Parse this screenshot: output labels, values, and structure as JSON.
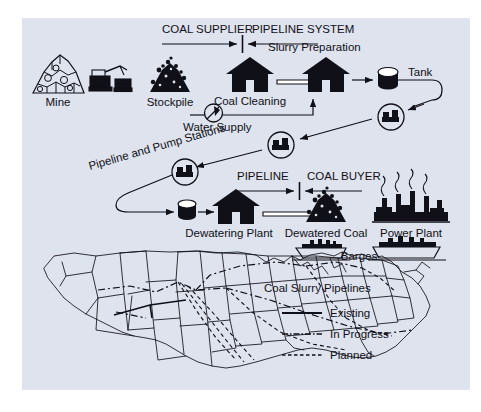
{
  "diagram": {
    "background_color": "#dfe3ed",
    "page_color": "#ffffff",
    "ink_color": "#101018"
  },
  "zones": [
    {
      "id": "coal-supplier",
      "label": "COAL SUPPLIER"
    },
    {
      "id": "pipeline-system",
      "label": "PIPELINE SYSTEM"
    },
    {
      "id": "pipeline",
      "label": "PIPELINE"
    },
    {
      "id": "coal-buyer",
      "label": "COAL BUYER"
    }
  ],
  "nodes": [
    {
      "id": "mine",
      "label": "Mine",
      "icon": "mine-icon"
    },
    {
      "id": "stockpile",
      "label": "Stockpile",
      "icon": "stockpile-icon"
    },
    {
      "id": "water-supply",
      "label": "Water Supply",
      "icon": "water-valve-icon"
    },
    {
      "id": "coal-cleaning",
      "label": "Coal Cleaning",
      "icon": "plant-building-icon"
    },
    {
      "id": "slurry-preparation",
      "label": "Slurry Preparation",
      "icon": "plant-building-icon"
    },
    {
      "id": "tank",
      "label": "Tank",
      "icon": "tank-icon"
    },
    {
      "id": "pump-stations",
      "label": "Pipeline and Pump Stations",
      "icon": "pump-station-icon"
    },
    {
      "id": "dewatering-plant",
      "label": "Dewatering Plant",
      "icon": "plant-building-icon"
    },
    {
      "id": "dewatered-coal",
      "label": "Dewatered Coal",
      "icon": "coal-pile-icon"
    },
    {
      "id": "power-plant",
      "label": "Power Plant",
      "icon": "power-plant-icon"
    },
    {
      "id": "barges",
      "label": "Barges",
      "icon": "barge-icon"
    }
  ],
  "legend": {
    "title": "Coal Slurry Pipelines",
    "entries": [
      {
        "label": "Existing",
        "style": "solid"
      },
      {
        "label": "In Progress",
        "style": "dash-dot"
      },
      {
        "label": "Planned",
        "style": "dashed"
      }
    ]
  },
  "map": {
    "name": "United States",
    "description": "Outline map of the contiguous United States with state boundaries and coal slurry pipeline routes overlaid"
  }
}
